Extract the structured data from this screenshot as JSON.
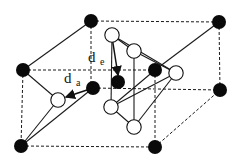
{
  "figure": {
    "type": "crystal-structure-diagram",
    "labels": {
      "d_e": {
        "base": "d",
        "sub": "e",
        "x": 88,
        "y": 62,
        "sub_x": 100,
        "sub_y": 65
      },
      "d_a": {
        "base": "d",
        "sub": "a",
        "x": 64,
        "y": 83,
        "sub_x": 76,
        "sub_y": 86
      }
    },
    "colors": {
      "black_atom": "#0a0a0a",
      "white_atom_fill": "#ffffff",
      "line": "#1a1a1a"
    },
    "black_atoms": [
      {
        "id": "top-back-left",
        "x": 91,
        "y": 21
      },
      {
        "id": "top-back-right",
        "x": 219,
        "y": 22
      },
      {
        "id": "mid-left",
        "x": 23,
        "y": 70
      },
      {
        "id": "mid-center",
        "x": 155,
        "y": 70
      },
      {
        "id": "front-center",
        "x": 93,
        "y": 88
      },
      {
        "id": "inner",
        "x": 118,
        "y": 82
      },
      {
        "id": "right-mid",
        "x": 220,
        "y": 90
      },
      {
        "id": "bottom-left",
        "x": 21,
        "y": 146
      },
      {
        "id": "bottom-front",
        "x": 155,
        "y": 147
      }
    ],
    "white_atoms": [
      {
        "id": "w-top",
        "x": 112,
        "y": 35
      },
      {
        "id": "w-upper",
        "x": 134,
        "y": 51
      },
      {
        "id": "w-right",
        "x": 176,
        "y": 73
      },
      {
        "id": "w-left",
        "x": 58,
        "y": 100
      },
      {
        "id": "w-mid",
        "x": 111,
        "y": 107
      },
      {
        "id": "w-bottom",
        "x": 134,
        "y": 127
      }
    ],
    "dashed_edges": [
      [
        91,
        21,
        219,
        22
      ],
      [
        91,
        21,
        91,
        88
      ],
      [
        23,
        70,
        155,
        70
      ],
      [
        23,
        70,
        21,
        146
      ],
      [
        219,
        22,
        220,
        90
      ],
      [
        93,
        88,
        220,
        90
      ],
      [
        21,
        146,
        155,
        147
      ],
      [
        155,
        70,
        155,
        147
      ],
      [
        155,
        147,
        220,
        90
      ]
    ],
    "solid_edges": [
      [
        23,
        70,
        91,
        21
      ],
      [
        155,
        70,
        219,
        22
      ],
      [
        23,
        70,
        58,
        100
      ],
      [
        58,
        100,
        21,
        146
      ],
      [
        93,
        88,
        21,
        146
      ],
      [
        112,
        35,
        134,
        51
      ],
      [
        112,
        35,
        111,
        107
      ],
      [
        112,
        35,
        176,
        73
      ],
      [
        134,
        51,
        176,
        73
      ],
      [
        134,
        51,
        134,
        127
      ],
      [
        111,
        107,
        176,
        73
      ],
      [
        111,
        107,
        134,
        127
      ],
      [
        134,
        127,
        176,
        73
      ],
      [
        111,
        107,
        155,
        70
      ]
    ],
    "arrows": [
      {
        "name": "d_e-arrow",
        "x1": 112,
        "y1": 37,
        "x2": 118,
        "y2": 75
      },
      {
        "name": "d_a-arrow",
        "x1": 93,
        "y1": 88,
        "x2": 66,
        "y2": 97
      }
    ]
  }
}
